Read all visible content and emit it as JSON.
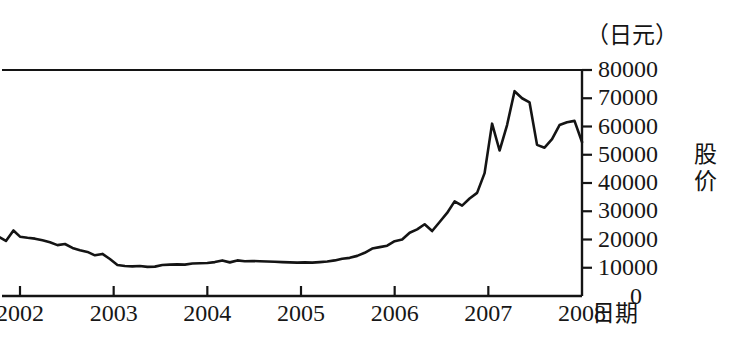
{
  "chart_data": {
    "type": "line",
    "title": "",
    "unit_label": "（日元）",
    "xlabel": "日期",
    "ylabel": "股价",
    "xlim": [
      2001.75,
      2008.0
    ],
    "ylim": [
      0,
      80000
    ],
    "grid": false,
    "legend": null,
    "x_ticks": [
      2002,
      2003,
      2004,
      2005,
      2006,
      2007,
      2008
    ],
    "x_tick_labels": [
      "2002",
      "2003",
      "2004",
      "2005",
      "2006",
      "2007",
      "2008"
    ],
    "y_ticks": [
      0,
      10000,
      20000,
      30000,
      40000,
      50000,
      60000,
      70000,
      80000
    ],
    "y_tick_labels": [
      "0",
      "10000",
      "20000",
      "30000",
      "40000",
      "50000",
      "60000",
      "70000",
      "80000"
    ],
    "series": [
      {
        "name": "股价",
        "color": "#141414",
        "x": [
          2001.77,
          2001.85,
          2001.93,
          2002.0,
          2002.08,
          2002.16,
          2002.24,
          2002.32,
          2002.4,
          2002.48,
          2002.56,
          2002.64,
          2002.72,
          2002.8,
          2002.88,
          2002.96,
          2003.04,
          2003.12,
          2003.2,
          2003.28,
          2003.36,
          2003.44,
          2003.52,
          2003.6,
          2003.68,
          2003.76,
          2003.84,
          2003.92,
          2004.0,
          2004.08,
          2004.16,
          2004.24,
          2004.32,
          2004.4,
          2004.48,
          2004.56,
          2004.64,
          2004.72,
          2004.8,
          2004.88,
          2004.96,
          2005.04,
          2005.12,
          2005.2,
          2005.28,
          2005.36,
          2005.44,
          2005.52,
          2005.6,
          2005.68,
          2005.76,
          2005.84,
          2005.92,
          2006.0,
          2006.08,
          2006.16,
          2006.24,
          2006.32,
          2006.4,
          2006.48,
          2006.56,
          2006.64,
          2006.72,
          2006.8,
          2006.88,
          2006.96,
          2007.04,
          2007.12,
          2007.2,
          2007.28,
          2007.36,
          2007.44,
          2007.52,
          2007.6,
          2007.68,
          2007.76,
          2007.84,
          2007.92,
          2008.0
        ],
        "values": [
          21000,
          19500,
          23200,
          21000,
          20600,
          20300,
          19700,
          19000,
          18000,
          18400,
          17000,
          16200,
          15600,
          14400,
          14900,
          13100,
          11000,
          10600,
          10500,
          10600,
          10300,
          10400,
          11000,
          11100,
          11200,
          11100,
          11500,
          11600,
          11700,
          12000,
          12600,
          11900,
          12600,
          12300,
          12400,
          12300,
          12200,
          12100,
          12000,
          11900,
          11800,
          11900,
          11800,
          12000,
          12200,
          12600,
          13200,
          13500,
          14200,
          15300,
          16800,
          17300,
          17800,
          19400,
          20000,
          22400,
          23600,
          25400,
          23000,
          26200,
          29400,
          33500,
          32000,
          34500,
          36500,
          43500,
          61000,
          51500,
          60500,
          72500,
          70000,
          68500,
          53500,
          52500,
          55500,
          60500,
          61500,
          62000,
          54500
        ]
      }
    ]
  },
  "axes": {
    "unit_header": "（日元）",
    "x_title": "日期",
    "y_title": "股价",
    "zero_label": "0"
  }
}
